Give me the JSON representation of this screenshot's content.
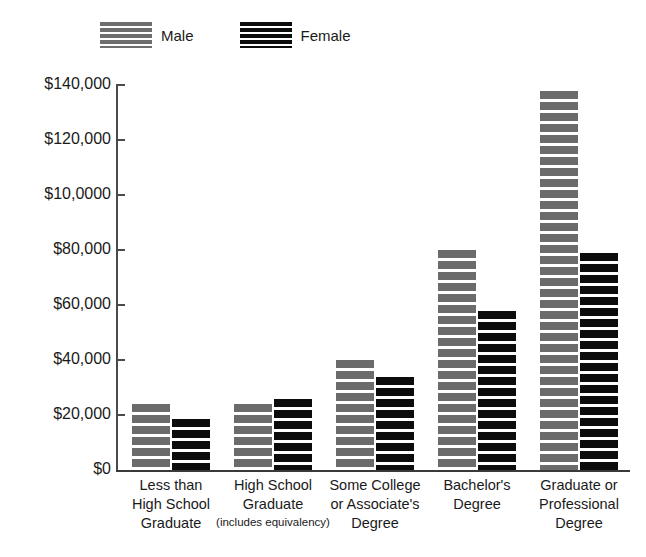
{
  "chart_data": {
    "type": "bar",
    "title": "",
    "subtitle": "",
    "xlabel": "",
    "ylabel": "",
    "ylim": [
      0,
      140000
    ],
    "grid": false,
    "legend_position": "top-left",
    "y_ticks": [
      {
        "value": 140000,
        "label": "$140,000"
      },
      {
        "value": 120000,
        "label": "$120,000"
      },
      {
        "value": 100000,
        "label": "$10,0000"
      },
      {
        "value": 80000,
        "label": "$80,000"
      },
      {
        "value": 60000,
        "label": "$60,000"
      },
      {
        "value": 40000,
        "label": "$40,000"
      },
      {
        "value": 20000,
        "label": "$20,000"
      },
      {
        "value": 0,
        "label": "$0"
      }
    ],
    "categories": [
      "Less than\nHigh School\nGraduate",
      "High School\nGraduate\n(includes equivalency)",
      "Some College\nor Associate's\nDegree",
      "Bachelor's\nDegree",
      "Graduate or\nProfessional\nDegree"
    ],
    "category_lines": [
      {
        "lines": [
          "Less than",
          "High School",
          "Graduate"
        ],
        "small_last": false
      },
      {
        "lines": [
          "High School",
          "Graduate",
          "(includes equivalency)"
        ],
        "small_last": true
      },
      {
        "lines": [
          "Some College",
          "or Associate's",
          "Degree"
        ],
        "small_last": false
      },
      {
        "lines": [
          "Bachelor's",
          "Degree"
        ],
        "small_last": false
      },
      {
        "lines": [
          "Graduate or",
          "Professional",
          "Degree"
        ],
        "small_last": false
      }
    ],
    "series": [
      {
        "name": "Male",
        "color": "#6b6b6b",
        "values": [
          24000,
          24000,
          40000,
          80000,
          138000
        ]
      },
      {
        "name": "Female",
        "color": "#0c0c0c",
        "values": [
          18500,
          26000,
          34000,
          58000,
          79000
        ]
      }
    ]
  },
  "legend": {
    "items": [
      {
        "label": "Male",
        "swatch": "striped-gray-swatch"
      },
      {
        "label": "Female",
        "swatch": "striped-black-swatch"
      }
    ]
  }
}
